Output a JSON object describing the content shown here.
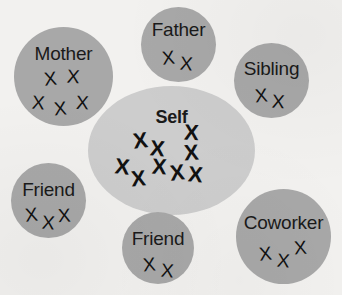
{
  "diagram": {
    "background_color": "#f2f1ef",
    "satellite_color": "#a8a8a8",
    "center_color": "#cdcdcd",
    "mark_glyph": "X",
    "text_color": "#1a1a1a"
  },
  "nodes": [
    {
      "id": "self",
      "label": "Self",
      "shape": "ellipse",
      "emphasis": "bold",
      "mark_count": 9,
      "x": 88,
      "y": 86,
      "width": 167,
      "height": 129,
      "label_top": 22,
      "marks": [
        {
          "x": 45,
          "y": 44,
          "rot": -7
        },
        {
          "x": 62,
          "y": 52,
          "rot": 5
        },
        {
          "x": 96,
          "y": 36,
          "rot": 3
        },
        {
          "x": 96,
          "y": 56,
          "rot": -4
        },
        {
          "x": 27,
          "y": 70,
          "rot": 6
        },
        {
          "x": 43,
          "y": 82,
          "rot": -5
        },
        {
          "x": 64,
          "y": 70,
          "rot": 4
        },
        {
          "x": 82,
          "y": 76,
          "rot": -6
        },
        {
          "x": 100,
          "y": 78,
          "rot": 5
        }
      ]
    },
    {
      "id": "mother",
      "label": "Mother",
      "shape": "circle",
      "mark_count": 5,
      "x": 14,
      "y": 27,
      "width": 99,
      "height": 99,
      "label_top": 17,
      "marks": [
        {
          "x": 30,
          "y": 42,
          "rot": -6
        },
        {
          "x": 53,
          "y": 40,
          "rot": 4
        },
        {
          "x": 18,
          "y": 66,
          "rot": 5
        },
        {
          "x": 40,
          "y": 72,
          "rot": -5
        },
        {
          "x": 62,
          "y": 66,
          "rot": 3
        }
      ]
    },
    {
      "id": "father",
      "label": "Father",
      "shape": "circle",
      "mark_count": 2,
      "x": 141,
      "y": 7,
      "width": 75,
      "height": 75,
      "label_top": 13,
      "marks": [
        {
          "x": 21,
          "y": 41,
          "rot": -6
        },
        {
          "x": 39,
          "y": 47,
          "rot": 5
        }
      ]
    },
    {
      "id": "sibling",
      "label": "Sibling",
      "shape": "circle",
      "mark_count": 2,
      "x": 234,
      "y": 43,
      "width": 75,
      "height": 75,
      "label_top": 16,
      "marks": [
        {
          "x": 21,
          "y": 43,
          "rot": -5
        },
        {
          "x": 38,
          "y": 49,
          "rot": 4
        }
      ]
    },
    {
      "id": "friend-left",
      "label": "Friend",
      "shape": "circle",
      "mark_count": 3,
      "x": 11,
      "y": 163,
      "width": 75,
      "height": 75,
      "label_top": 17,
      "marks": [
        {
          "x": 14,
          "y": 42,
          "rot": -6
        },
        {
          "x": 31,
          "y": 50,
          "rot": 5
        },
        {
          "x": 47,
          "y": 43,
          "rot": -3
        }
      ]
    },
    {
      "id": "friend-bottom",
      "label": "Friend",
      "shape": "circle",
      "mark_count": 2,
      "x": 122,
      "y": 212,
      "width": 72,
      "height": 72,
      "label_top": 17,
      "marks": [
        {
          "x": 21,
          "y": 43,
          "rot": -5
        },
        {
          "x": 39,
          "y": 49,
          "rot": 5
        }
      ]
    },
    {
      "id": "coworker",
      "label": "Coworker",
      "shape": "circle",
      "mark_count": 3,
      "x": 236,
      "y": 189,
      "width": 95,
      "height": 95,
      "label_top": 24,
      "marks": [
        {
          "x": 23,
          "y": 55,
          "rot": -6
        },
        {
          "x": 41,
          "y": 62,
          "rot": 5
        },
        {
          "x": 58,
          "y": 49,
          "rot": -4
        }
      ]
    }
  ]
}
